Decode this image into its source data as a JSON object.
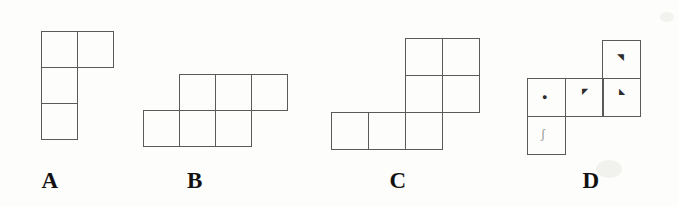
{
  "figure": {
    "background_color": "#fdfdfb",
    "stroke_color": "#5a5a5a",
    "label_color": "#111111",
    "width": 678,
    "height": 206
  },
  "options": [
    {
      "id": "A",
      "label": "A",
      "label_x": 48,
      "label_y": 170,
      "origin_x": 41,
      "origin_y": 31,
      "cell_size": 36,
      "cell_count": 4,
      "cells": [
        {
          "col": 0,
          "row": 0,
          "mark": ""
        },
        {
          "col": 1,
          "row": 0,
          "mark": ""
        },
        {
          "col": 0,
          "row": 1,
          "mark": ""
        },
        {
          "col": 0,
          "row": 2,
          "mark": ""
        }
      ]
    },
    {
      "id": "B",
      "label": "B",
      "label_x": 193,
      "label_y": 170,
      "origin_x": 143,
      "origin_y": 74,
      "cell_size": 36,
      "cell_count": 6,
      "cells": [
        {
          "col": 1,
          "row": 0,
          "mark": ""
        },
        {
          "col": 2,
          "row": 0,
          "mark": ""
        },
        {
          "col": 3,
          "row": 0,
          "mark": ""
        },
        {
          "col": 0,
          "row": 1,
          "mark": ""
        },
        {
          "col": 1,
          "row": 1,
          "mark": ""
        },
        {
          "col": 2,
          "row": 1,
          "mark": ""
        }
      ]
    },
    {
      "id": "C",
      "label": "C",
      "label_x": 395,
      "label_y": 170,
      "origin_x": 331,
      "origin_y": 38,
      "cell_size": 37,
      "cell_count": 7,
      "cells": [
        {
          "col": 2,
          "row": 0,
          "mark": ""
        },
        {
          "col": 3,
          "row": 0,
          "mark": ""
        },
        {
          "col": 2,
          "row": 1,
          "mark": ""
        },
        {
          "col": 3,
          "row": 1,
          "mark": ""
        },
        {
          "col": 0,
          "row": 2,
          "mark": ""
        },
        {
          "col": 1,
          "row": 2,
          "mark": ""
        },
        {
          "col": 2,
          "row": 2,
          "mark": ""
        }
      ]
    },
    {
      "id": "D",
      "label": "D",
      "label_x": 588,
      "label_y": 170,
      "origin_x": 527,
      "origin_y": 40,
      "cell_size": 38,
      "cell_count": 5,
      "cells": [
        {
          "col": 2,
          "row": 0,
          "mark": "◥"
        },
        {
          "col": 0,
          "row": 1,
          "mark": "●"
        },
        {
          "col": 1,
          "row": 1,
          "mark": "◤"
        },
        {
          "col": 2,
          "row": 1,
          "mark": "◣"
        },
        {
          "col": 0,
          "row": 2,
          "mark": "ʃ"
        }
      ]
    }
  ]
}
